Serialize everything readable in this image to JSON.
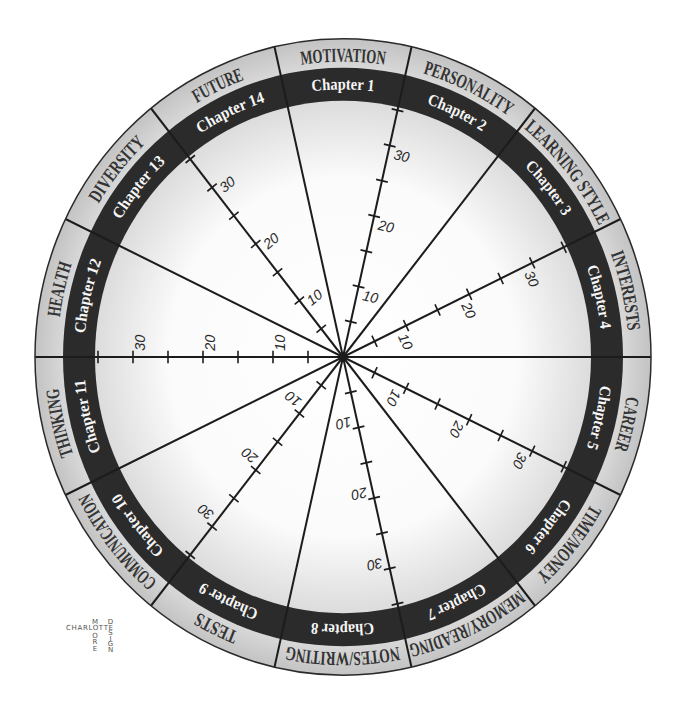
{
  "wheel": {
    "segments": [
      {
        "chapter": "Chapter 1",
        "category": "MOTIVATION"
      },
      {
        "chapter": "Chapter 2",
        "category": "PERSONALITY"
      },
      {
        "chapter": "Chapter 3",
        "category": "LEARNING STYLE"
      },
      {
        "chapter": "Chapter 4",
        "category": "INTERESTS"
      },
      {
        "chapter": "Chapter 5",
        "category": "CAREER"
      },
      {
        "chapter": "Chapter 6",
        "category": "TIME/MONEY"
      },
      {
        "chapter": "Chapter 7",
        "category": "MEMORY/READING"
      },
      {
        "chapter": "Chapter 8",
        "category": "NOTES/WRITING"
      },
      {
        "chapter": "Chapter 9",
        "category": "TESTS"
      },
      {
        "chapter": "Chapter 10",
        "category": "COMMUNICATION"
      },
      {
        "chapter": "Chapter 11",
        "category": "THINKING"
      },
      {
        "chapter": "Chapter 12",
        "category": "HEALTH"
      },
      {
        "chapter": "Chapter 13",
        "category": "DIVERSITY"
      },
      {
        "chapter": "Chapter 14",
        "category": "FUTURE"
      }
    ],
    "scale": {
      "ticks": [
        5,
        10,
        15,
        20,
        25,
        30,
        35
      ],
      "labeled_values": [
        10,
        20,
        30
      ],
      "labels": [
        "10",
        "20",
        "30"
      ]
    },
    "scale_lines": [
      {
        "between": [
          "Chapter 1",
          "Chapter 2"
        ]
      },
      {
        "between": [
          "Chapter 3",
          "Chapter 4"
        ]
      },
      {
        "between": [
          "Chapter 5",
          "Chapter 6"
        ]
      },
      {
        "between": [
          "Chapter 7",
          "Chapter 8"
        ]
      },
      {
        "between": [
          "Chapter 9",
          "Chapter 10"
        ]
      },
      {
        "between": [
          "Chapter 11",
          "Chapter 12"
        ]
      },
      {
        "between": [
          "Chapter 13",
          "Chapter 14"
        ]
      }
    ],
    "colors": {
      "category_ring_light": "#dadada",
      "category_ring_dark": "#c3c3c3",
      "chapter_ring": "#2b2b2b",
      "inner_center": "#ffffff",
      "inner_edge": "#dcdcdc",
      "category_text": "#333333",
      "chapter_text": "#f6f6f6",
      "spoke": "#1c1c1c",
      "scale_text": "#2a2a2a",
      "border": "#2a2a2a"
    }
  },
  "logo": {
    "horizontal": "CHARLOTTE",
    "vertical_1": "MOORE",
    "vertical_2": "DESIGN",
    "color": "#555555"
  }
}
